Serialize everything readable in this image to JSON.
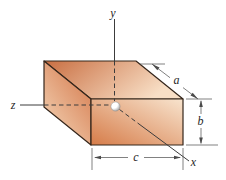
{
  "figure": {
    "type": "oblique-rectangular-box-diagram",
    "axis_labels": {
      "x": "x",
      "y": "y",
      "z": "z"
    },
    "dimension_labels": {
      "a": "a",
      "b": "b",
      "c": "c"
    },
    "colors": {
      "top_face_dark": "#c96e41",
      "top_face_light": "#f8dfc6",
      "front_face_dark": "#d67c49",
      "front_face_light": "#f8e4ce",
      "left_face_dark": "#d4774a",
      "left_face_light": "#f4d6b8",
      "edge": "#35261b",
      "axis": "#3c3c3c",
      "dimension": "#4a4a4a",
      "sphere_light": "#ffffff",
      "sphere_dark": "#8f8f8f",
      "background": "#ffffff"
    }
  }
}
